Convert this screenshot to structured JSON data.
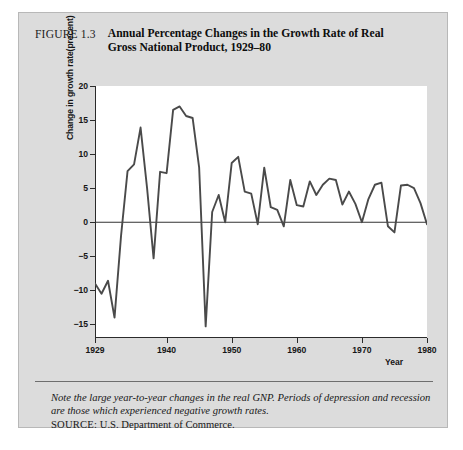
{
  "figure": {
    "number": "FIGURE 1.3",
    "title": "Annual Percentage Changes in the Growth Rate of Real Gross National Product, 1929–80",
    "note": "Note the large year-to-year changes in the real GNP.  Periods of depression and recession are those which experienced negative growth rates.",
    "source_label": "SOURCE:",
    "source_text": "U.S. Department of Commerce."
  },
  "chart_data": {
    "type": "line",
    "title": "Annual Percentage Changes in the Growth Rate of Real Gross National Product, 1929–80",
    "xlabel": "Year",
    "ylabel": "Change in growth rate(precent)",
    "xlim": [
      1929,
      1980
    ],
    "ylim": [
      -17,
      20
    ],
    "yticks": [
      20,
      15,
      10,
      5,
      0,
      -5,
      -10,
      -15
    ],
    "ytick_labels": [
      "20",
      "15",
      "10",
      "5",
      "0",
      "−5",
      "−10",
      "−15"
    ],
    "xticks": [
      1929,
      1940,
      1950,
      1960,
      1970,
      1980
    ],
    "xtick_labels": [
      "1929",
      "1940",
      "1950",
      "1960",
      "1970",
      "1980"
    ],
    "grid": false,
    "legend": "none",
    "zero_line": 0,
    "line_color": "#4a4a4a",
    "x": [
      1929,
      1930,
      1931,
      1932,
      1933,
      1934,
      1935,
      1936,
      1937,
      1938,
      1939,
      1940,
      1941,
      1942,
      1943,
      1944,
      1945,
      1946,
      1947,
      1948,
      1949,
      1950,
      1951,
      1952,
      1953,
      1954,
      1955,
      1956,
      1957,
      1958,
      1959,
      1960,
      1961,
      1962,
      1963,
      1964,
      1965,
      1966,
      1967,
      1968,
      1969,
      1970,
      1971,
      1972,
      1973,
      1974,
      1975,
      1976,
      1977,
      1978,
      1979,
      1980
    ],
    "values": [
      -9.0,
      -10.5,
      -8.6,
      -14.0,
      -2.0,
      7.5,
      8.5,
      13.9,
      5.0,
      -5.3,
      7.4,
      7.2,
      16.5,
      17.0,
      15.6,
      15.3,
      8.0,
      -15.3,
      1.5,
      4.0,
      0.0,
      8.7,
      9.6,
      4.5,
      4.2,
      -0.3,
      8.0,
      2.2,
      1.8,
      -0.6,
      6.2,
      2.5,
      2.3,
      6.0,
      4.0,
      5.5,
      6.4,
      6.2,
      2.6,
      4.5,
      2.7,
      0.0,
      3.4,
      5.5,
      5.8,
      -0.6,
      -1.5,
      5.4,
      5.5,
      5.0,
      2.8,
      -0.3
    ]
  }
}
